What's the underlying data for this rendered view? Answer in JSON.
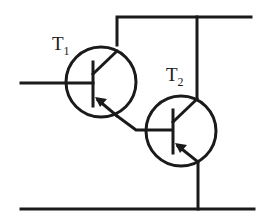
{
  "diagram": {
    "type": "circuit",
    "stroke_color": "#1a1a1a",
    "transistors": [
      {
        "id": "T1",
        "label_main": "T",
        "label_sub": "1",
        "type": "NPN"
      },
      {
        "id": "T2",
        "label_main": "T",
        "label_sub": "2",
        "type": "NPN"
      }
    ]
  }
}
